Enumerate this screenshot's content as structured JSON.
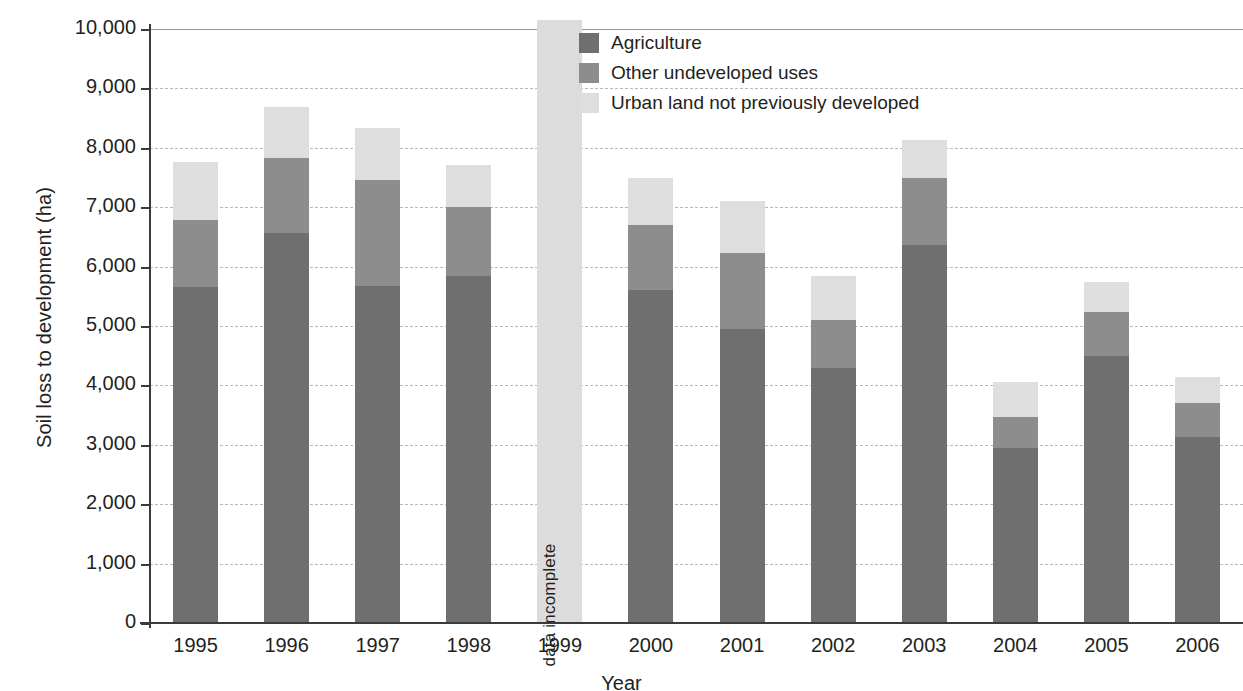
{
  "chart_data": {
    "type": "bar",
    "subtype": "stacked-column",
    "title": "",
    "xlabel": "Year",
    "ylabel": "Soil loss to development (ha)",
    "categories": [
      "1995",
      "1996",
      "1997",
      "1998",
      "1999",
      "2000",
      "2001",
      "2002",
      "2003",
      "2004",
      "2005",
      "2006"
    ],
    "ylim": [
      0,
      10000
    ],
    "yticks": [
      0,
      1000,
      2000,
      3000,
      4000,
      5000,
      6000,
      7000,
      8000,
      9000,
      10000
    ],
    "ytick_labels": [
      "0",
      "1,000",
      "2,000",
      "3,000",
      "4,000",
      "5,000",
      "6,000",
      "7,000",
      "8,000",
      "9,000",
      "10,000"
    ],
    "grid": true,
    "legend_position": "inside-top-center",
    "series": [
      {
        "name": "Agriculture",
        "color": "#6f6f6f",
        "values": [
          5650,
          6570,
          5670,
          5840,
          null,
          5610,
          4950,
          4290,
          6360,
          2950,
          4500,
          3130
        ]
      },
      {
        "name": "Other undeveloped uses",
        "color": "#8d8d8d",
        "values": [
          1130,
          1260,
          1780,
          1160,
          null,
          1090,
          1280,
          810,
          1130,
          520,
          730,
          570
        ]
      },
      {
        "name": "Urban land not previously developed",
        "color": "#dedede",
        "values": [
          980,
          850,
          890,
          710,
          null,
          790,
          870,
          740,
          640,
          580,
          510,
          450
        ]
      }
    ],
    "totals": [
      7760,
      8680,
      8340,
      7710,
      null,
      7490,
      7100,
      5840,
      8130,
      4050,
      5740,
      4150
    ],
    "annotations": [
      {
        "category": "1999",
        "text": "data incomplete",
        "orientation": "vertical",
        "bar_color": "#dcdcdc",
        "note": "single full-height bar exceeding the 10,000 axis maximum"
      }
    ]
  },
  "axis": {
    "y_title": "Soil loss to development (ha)",
    "x_title": "Year"
  },
  "legend": {
    "items": [
      {
        "label": "Agriculture",
        "color": "#6f6f6f"
      },
      {
        "label": "Other undeveloped uses",
        "color": "#8d8d8d"
      },
      {
        "label": "Urban land not previously developed",
        "color": "#dedede"
      }
    ]
  },
  "colors": {
    "agriculture": "#6f6f6f",
    "other_undeveloped": "#8d8d8d",
    "urban_land": "#dedede",
    "incomplete_bar": "#dcdcdc",
    "axis": "#3b3b3b",
    "gridline": "#b9b9b9",
    "text": "#231f20"
  }
}
